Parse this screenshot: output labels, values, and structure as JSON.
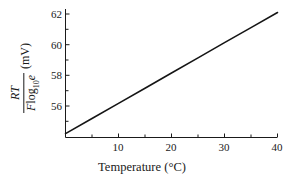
{
  "chart_data": {
    "type": "line",
    "title": "",
    "xlabel": "Temperature (°C)",
    "ylabel": "RT / (F log10 e)  (mV)",
    "ylabel_parts": {
      "numerator": "RT",
      "denominator_italic_1": "F",
      "denominator_roman": "log",
      "denominator_subscript": "10",
      "denominator_italic_2": "e",
      "unit": "(mV)"
    },
    "xlim": [
      0,
      41.5
    ],
    "ylim": [
      54.0,
      62.4
    ],
    "xticks": [
      10,
      20,
      30,
      40
    ],
    "xticks_minor": [
      5,
      15,
      25,
      35
    ],
    "yticks": [
      56,
      58,
      60,
      62
    ],
    "yticks_minor": [
      55,
      57,
      59,
      61
    ],
    "xtick_labels": [
      "10",
      "20",
      "30",
      "40"
    ],
    "ytick_labels": [
      "56",
      "58",
      "60",
      "62"
    ],
    "grid": false,
    "legend": false,
    "line_color": "#151515",
    "line_width_px": 1.6,
    "series": [
      {
        "name": "RT/(F log10 e)",
        "x": [
          0,
          5,
          10,
          15,
          20,
          25,
          30,
          35,
          40
        ],
        "values": [
          54.2,
          55.18,
          56.17,
          57.16,
          58.15,
          59.14,
          60.13,
          61.11,
          62.1
        ]
      }
    ],
    "annotations": []
  },
  "axes": {
    "x_title": "Temperature",
    "x_unit": "(°C)",
    "y_unit": "(mV)"
  }
}
